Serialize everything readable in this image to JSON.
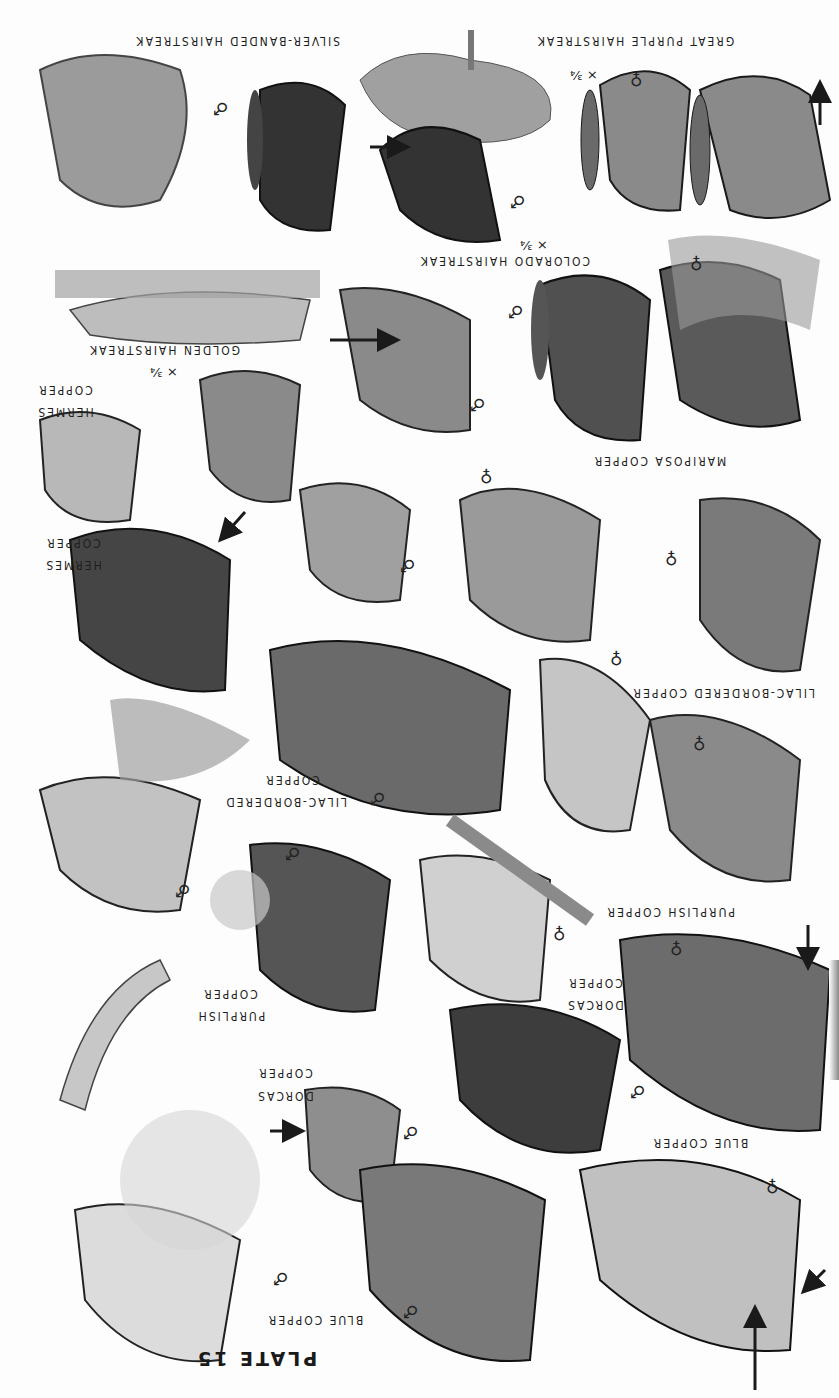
{
  "plate": {
    "title": "PLATE 15",
    "orientation": "rotated 180°"
  },
  "species_labels": [
    {
      "id": "great-purple-hairstreak",
      "text": "GREAT PURPLE HAIRSTREAK",
      "x": 535,
      "y": 34,
      "w": 200
    },
    {
      "id": "silver-banded-hairstreak",
      "text": "SILVER-BANDED HAIRSTREAK",
      "x": 140,
      "y": 34,
      "w": 200
    },
    {
      "id": "colorado-hairstreak",
      "text": "COLORADO HAIRSTREAK",
      "x": 425,
      "y": 254,
      "w": 165
    },
    {
      "id": "golden-hairstreak",
      "text": "GOLDEN HAIRSTREAK",
      "x": 90,
      "y": 343,
      "w": 150
    },
    {
      "id": "hermes-copper-1a",
      "text": "HERMES",
      "x": 35,
      "y": 405,
      "w": 60
    },
    {
      "id": "hermes-copper-1b",
      "text": "COPPER",
      "x": 35,
      "y": 383,
      "w": 60
    },
    {
      "id": "mariposa-copper",
      "text": "MARIPOSA COPPER",
      "x": 592,
      "y": 454,
      "w": 135
    },
    {
      "id": "hermes-copper-2a",
      "text": "HERMES",
      "x": 43,
      "y": 558,
      "w": 60
    },
    {
      "id": "hermes-copper-2b",
      "text": "COPPER",
      "x": 43,
      "y": 536,
      "w": 60
    },
    {
      "id": "lilac-bordered-copper-right",
      "text": "LILAC-BORDERED COPPER",
      "x": 635,
      "y": 686,
      "w": 180
    },
    {
      "id": "lilac-bordered-copper-left-a",
      "text": "LILAC-BORDERED",
      "x": 232,
      "y": 795,
      "w": 115
    },
    {
      "id": "lilac-bordered-copper-left-b",
      "text": "COPPER",
      "x": 262,
      "y": 773,
      "w": 60
    },
    {
      "id": "purplish-copper-right",
      "text": "PURPLISH COPPER",
      "x": 610,
      "y": 905,
      "w": 125
    },
    {
      "id": "purplish-copper-left-a",
      "text": "PURPLISH",
      "x": 196,
      "y": 1009,
      "w": 70
    },
    {
      "id": "purplish-copper-left-b",
      "text": "COPPER",
      "x": 200,
      "y": 987,
      "w": 60
    },
    {
      "id": "dorcas-copper-right-a",
      "text": "DORCAS",
      "x": 565,
      "y": 998,
      "w": 60
    },
    {
      "id": "dorcas-copper-right-b",
      "text": "COPPER",
      "x": 565,
      "y": 976,
      "w": 60
    },
    {
      "id": "dorcas-copper-left-a",
      "text": "DORCAS",
      "x": 255,
      "y": 1089,
      "w": 60
    },
    {
      "id": "dorcas-copper-left-b",
      "text": "COPPER",
      "x": 255,
      "y": 1066,
      "w": 60
    },
    {
      "id": "blue-copper-right",
      "text": "BLUE COPPER",
      "x": 650,
      "y": 1136,
      "w": 100
    },
    {
      "id": "blue-copper-left",
      "text": "BLUE COPPER",
      "x": 265,
      "y": 1313,
      "w": 100
    }
  ],
  "scale_marks": [
    {
      "id": "scale-great-purple",
      "text": "× ³⁄₄",
      "x": 570,
      "y": 68
    },
    {
      "id": "scale-colorado",
      "text": "× ³⁄₄",
      "x": 520,
      "y": 238
    },
    {
      "id": "scale-golden",
      "text": "× ³⁄₄",
      "x": 150,
      "y": 365
    }
  ],
  "sex_symbols": [
    {
      "id": "sex-great-purple-female",
      "text": "♀",
      "x": 630,
      "y": 71
    },
    {
      "id": "sex-great-purple-male",
      "text": "♂",
      "x": 510,
      "y": 193
    },
    {
      "id": "sex-silver-banded-male",
      "text": "♂",
      "x": 213,
      "y": 100
    },
    {
      "id": "sex-colorado-female",
      "text": "♀",
      "x": 690,
      "y": 255
    },
    {
      "id": "sex-colorado-male",
      "text": "♂",
      "x": 508,
      "y": 303
    },
    {
      "id": "sex-colorado-male-2",
      "text": "♂",
      "x": 470,
      "y": 396
    },
    {
      "id": "sex-mariposa-female",
      "text": "♀",
      "x": 480,
      "y": 468
    },
    {
      "id": "sex-mariposa-female-2",
      "text": "♀",
      "x": 665,
      "y": 550
    },
    {
      "id": "sex-hermes-male",
      "text": "♂",
      "x": 400,
      "y": 557
    },
    {
      "id": "sex-lilac-female",
      "text": "♀",
      "x": 610,
      "y": 650
    },
    {
      "id": "sex-lilac-female-2",
      "text": "♀",
      "x": 693,
      "y": 735
    },
    {
      "id": "sex-lilac-male",
      "text": "♂",
      "x": 370,
      "y": 790
    },
    {
      "id": "sex-lilac-male-2",
      "text": "♂",
      "x": 175,
      "y": 882
    },
    {
      "id": "sex-purplish-male",
      "text": "♂",
      "x": 285,
      "y": 845
    },
    {
      "id": "sex-purplish-female",
      "text": "♀",
      "x": 553,
      "y": 925
    },
    {
      "id": "sex-dorcas-female",
      "text": "♀",
      "x": 670,
      "y": 940
    },
    {
      "id": "sex-dorcas-male",
      "text": "♂",
      "x": 630,
      "y": 1083
    },
    {
      "id": "sex-dorcas-male-2",
      "text": "♂",
      "x": 403,
      "y": 1124
    },
    {
      "id": "sex-blue-copper-female",
      "text": "♀",
      "x": 766,
      "y": 1178
    },
    {
      "id": "sex-blue-copper-male",
      "text": "♂",
      "x": 273,
      "y": 1270
    },
    {
      "id": "sex-blue-copper-male-2",
      "text": "♂",
      "x": 403,
      "y": 1303
    }
  ],
  "colors": {
    "ink": "#1a1a1a",
    "paper": "#fdfdfd",
    "wing_dark": "#3a3a3a",
    "wing_mid": "#7a7a7a",
    "wing_light": "#c9c9c9",
    "plant": "#9a9a9a"
  }
}
